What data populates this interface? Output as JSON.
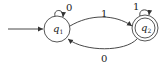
{
  "diagram": {
    "type": "finite-automaton",
    "states": [
      {
        "id": "q1",
        "label": "q",
        "subscript": "1",
        "start": true,
        "accepting": false
      },
      {
        "id": "q2",
        "label": "q",
        "subscript": "2",
        "start": false,
        "accepting": true
      }
    ],
    "transitions": [
      {
        "from": "q1",
        "to": "q1",
        "symbol": "0"
      },
      {
        "from": "q1",
        "to": "q2",
        "symbol": "1"
      },
      {
        "from": "q2",
        "to": "q2",
        "symbol": "1"
      },
      {
        "from": "q2",
        "to": "q1",
        "symbol": "0"
      }
    ],
    "colors": {
      "stroke": "#333333",
      "background": "#ffffff"
    }
  }
}
